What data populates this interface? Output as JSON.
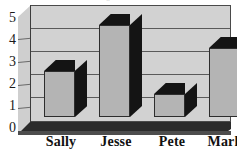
{
  "chart_data": {
    "type": "bar",
    "title": "",
    "xlabel": "",
    "ylabel": "",
    "categories": [
      "Sally",
      "Jesse",
      "Pete",
      "Mark"
    ],
    "values": [
      2,
      4,
      1,
      3
    ],
    "ylim": [
      0,
      5
    ],
    "yticks": [
      "0",
      "1",
      "2",
      "3",
      "4",
      "5"
    ],
    "grid": true,
    "legend": false,
    "style": "3d-perspective-grayscale",
    "colors": {
      "bar_face": "#b4b4b4",
      "bar_shadow": "#141414",
      "plot_background": "#d2d2d2",
      "wall": "#cfcfcf",
      "floor": "#2b2b2b",
      "gridline": "#5a5a5a",
      "text": "#111111"
    }
  },
  "axes": {
    "y_ticks": [
      {
        "label": "5",
        "value": 5
      },
      {
        "label": "4",
        "value": 4
      },
      {
        "label": "3",
        "value": 3
      },
      {
        "label": "2",
        "value": 2
      },
      {
        "label": "1",
        "value": 1
      },
      {
        "label": "0",
        "value": 0
      }
    ],
    "x_categories": [
      {
        "label": "Sally",
        "value": 2
      },
      {
        "label": "Jesse",
        "value": 4
      },
      {
        "label": "Pete",
        "value": 1
      },
      {
        "label": "Mark",
        "value": 3
      }
    ]
  },
  "title_remnant": "··"
}
